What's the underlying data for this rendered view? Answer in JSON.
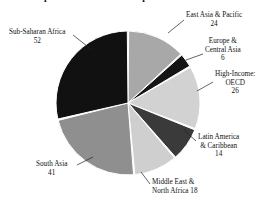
{
  "title": "Top Cities in 2050 with Population and Problems",
  "chart_data": {
    "type": "pie",
    "title": "Top Cities in 2050 with Population and Problems",
    "xlabel": "",
    "ylabel": "",
    "legend_position": "callout-labels",
    "grid": false,
    "total": 181,
    "categories": [
      "East Asia & Pacific",
      "Europe & Central Asia",
      "High-Income: OECD",
      "Latin America & Caribbean",
      "Middle East & North Africa",
      "South Asia",
      "Sub-Saharan Africa"
    ],
    "values": [
      24,
      6,
      26,
      14,
      18,
      41,
      52
    ],
    "colors": [
      "#a8a8a8",
      "#151515",
      "#d2d2d2",
      "#3a3a3a",
      "#cfcfcf",
      "#8f8f8f",
      "#111111"
    ]
  },
  "slices": [
    {
      "name": "East Asia & Pacific",
      "label_line1": "East Asia & Pacific",
      "value": "24",
      "color": "#a8a8a8"
    },
    {
      "name": "Europe & Central Asia",
      "label_line1": "Europe &",
      "label_line2": "Central Asia",
      "value": "6",
      "color": "#151515"
    },
    {
      "name": "High-Income: OECD",
      "label_line1": "High-Income:",
      "label_line2": "OECD",
      "value": "26",
      "color": "#d2d2d2"
    },
    {
      "name": "Latin America & Caribbean",
      "label_line1": "Latin America",
      "label_line2": "& Caribbean",
      "value": "14",
      "color": "#3a3a3a"
    },
    {
      "name": "Middle East & North Africa",
      "label_line1": "Middle East &",
      "label_line2": "North Africa 18",
      "value": "18",
      "color": "#cfcfcf"
    },
    {
      "name": "South Asia",
      "label_line1": "South Asia",
      "value": "41",
      "color": "#8f8f8f"
    },
    {
      "name": "Sub-Saharan Africa",
      "label_line1": "Sub-Saharan Africa",
      "value": "52",
      "color": "#111111"
    }
  ]
}
